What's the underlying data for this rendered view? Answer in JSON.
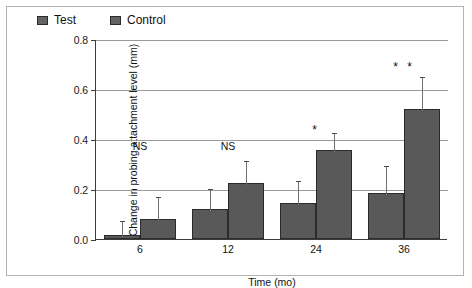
{
  "chart_data": {
    "type": "bar",
    "title": "",
    "xlabel": "Time (mo)",
    "ylabel": "Change in probing attachment level (mm)",
    "categories": [
      "6",
      "12",
      "24",
      "36"
    ],
    "ylim": [
      0.0,
      0.8
    ],
    "ytick_labels": [
      "0.0",
      "0.2",
      "0.4",
      "0.6",
      "0.8"
    ],
    "ytick_values": [
      0.0,
      0.2,
      0.4,
      0.6,
      0.8
    ],
    "grid": true,
    "legend_position": "top-left",
    "series": [
      {
        "name": "Test",
        "values": [
          0.015,
          0.12,
          0.145,
          0.185
        ],
        "errors": [
          0.055,
          0.075,
          0.085,
          0.105
        ]
      },
      {
        "name": "Control",
        "values": [
          0.08,
          0.225,
          0.355,
          0.52
        ],
        "errors": [
          0.085,
          0.085,
          0.065,
          0.125
        ]
      }
    ],
    "annotations": [
      {
        "category": "6",
        "text": "NS",
        "value": 0.4
      },
      {
        "category": "12",
        "text": "NS",
        "value": 0.4
      },
      {
        "category": "24",
        "text": "*",
        "value": 0.47
      },
      {
        "category": "36",
        "text": "* *",
        "value": 0.72
      }
    ]
  },
  "legend": {
    "items": [
      {
        "label": "Test"
      },
      {
        "label": "Control"
      }
    ]
  },
  "colors": {
    "bar_fill": "#595959",
    "bar_edge": "#2b2b2b",
    "grid": "#9a9a9a",
    "axis": "#3d3d3d",
    "frame": "#b3b3b3",
    "text": "#111111"
  }
}
